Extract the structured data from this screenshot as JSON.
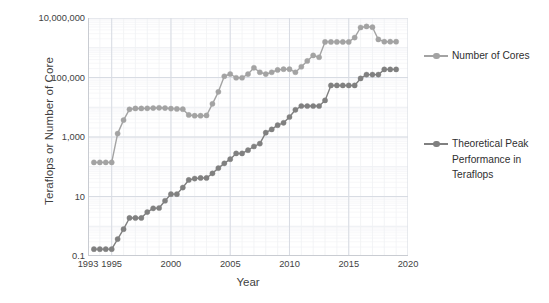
{
  "chart_data": {
    "type": "line",
    "title": "",
    "xlabel": "Year",
    "ylabel": "Teraflops or Number of Core",
    "xlim": [
      1993,
      2020
    ],
    "ylim": [
      0.1,
      10000000
    ],
    "yscale": "log",
    "xscale": "linear",
    "grid": true,
    "legend_position": "right",
    "x_ticks": [
      1993,
      1995,
      2000,
      2005,
      2010,
      2015,
      2020
    ],
    "x_tick_labels": [
      "1993",
      "1995",
      "2000",
      "2005",
      "2010",
      "2015",
      "2020"
    ],
    "y_ticks": [
      0.1,
      10,
      1000,
      100000,
      10000000
    ],
    "y_tick_labels": [
      "0.1",
      "10",
      "1,000",
      "100,000",
      "10,000,000"
    ],
    "series": [
      {
        "name": "Number of Cores",
        "color": "#a3a3a3",
        "marker": "circle",
        "x": [
          1993.5,
          1994.0,
          1994.5,
          1995.0,
          1995.5,
          1996.0,
          1996.5,
          1997.0,
          1997.5,
          1998.0,
          1998.5,
          1999.0,
          1999.5,
          2000.0,
          2000.5,
          2001.0,
          2001.5,
          2002.0,
          2002.5,
          2003.0,
          2003.5,
          2004.0,
          2004.5,
          2005.0,
          2005.5,
          2006.0,
          2006.5,
          2007.0,
          2007.5,
          2008.0,
          2008.5,
          2009.0,
          2009.5,
          2010.0,
          2010.5,
          2011.0,
          2011.5,
          2012.0,
          2012.5,
          2013.0,
          2013.5,
          2014.0,
          2014.5,
          2015.0,
          2015.5,
          2016.0,
          2016.5,
          2017.0,
          2017.5,
          2018.0,
          2018.5,
          2019.0
        ],
        "y": [
          140,
          140,
          140,
          140,
          1300,
          3700,
          8500,
          9100,
          9100,
          9200,
          9400,
          9600,
          9400,
          9000,
          8800,
          8600,
          5500,
          5200,
          5200,
          5300,
          13000,
          33000,
          110000,
          131000,
          98000,
          98000,
          130000,
          212000,
          150000,
          130000,
          150000,
          180000,
          190000,
          190000,
          150000,
          230000,
          360000,
          550000,
          480000,
          1570000,
          1570000,
          1570000,
          1570000,
          1570000,
          2200000,
          4800000,
          5200000,
          4900000,
          1900000,
          1600000,
          1600000,
          1600000
        ]
      },
      {
        "name": "Theoretical Peak Performance in Teraflops",
        "color": "#808080",
        "marker": "circle",
        "x": [
          1993.5,
          1994.0,
          1994.5,
          1995.0,
          1995.5,
          1996.0,
          1996.5,
          1997.0,
          1997.5,
          1998.0,
          1998.5,
          1999.0,
          1999.5,
          2000.0,
          2000.5,
          2001.0,
          2001.5,
          2002.0,
          2002.5,
          2003.0,
          2003.5,
          2004.0,
          2004.5,
          2005.0,
          2005.5,
          2006.0,
          2006.5,
          2007.0,
          2007.5,
          2008.0,
          2008.5,
          2009.0,
          2009.5,
          2010.0,
          2010.5,
          2011.0,
          2011.5,
          2012.0,
          2012.5,
          2013.0,
          2013.5,
          2014.0,
          2014.5,
          2015.0,
          2015.5,
          2016.0,
          2016.5,
          2017.0,
          2017.5,
          2018.0,
          2018.5,
          2019.0
        ],
        "y": [
          0.17,
          0.17,
          0.17,
          0.17,
          0.37,
          0.8,
          1.9,
          1.9,
          1.9,
          3.0,
          4.0,
          4.1,
          7.2,
          12.0,
          12.0,
          20.0,
          36.0,
          40.0,
          42.0,
          42.0,
          60.0,
          90.0,
          130.0,
          180.0,
          280.0,
          280.0,
          360.0,
          480.0,
          600.0,
          1400.0,
          1800.0,
          2500.0,
          3000.0,
          4700.0,
          8200.0,
          11000.0,
          11000.0,
          11000.0,
          11000.0,
          17000.0,
          54000.0,
          54000.0,
          54000.0,
          54000.0,
          54000.0,
          93000.0,
          125000.0,
          125000.0,
          125000.0,
          187000.0,
          187000.0,
          187000.0
        ]
      }
    ]
  },
  "legend": {
    "entries": [
      {
        "label": "Number of Cores",
        "color": "#a3a3a3"
      },
      {
        "label": "Theoretical Peak\nPerformance in\nTeraflops",
        "color": "#808080"
      }
    ]
  },
  "axes": {
    "y_title": "Teraflops or Number of Core",
    "x_title": "Year"
  },
  "colors": {
    "cores": "#a3a3a3",
    "performance": "#808080",
    "grid_major": "#d8dce3",
    "grid_minor": "#eceef2",
    "axis": "#c9ccd2",
    "text": "#3f3f3f",
    "background": "#ffffff"
  }
}
